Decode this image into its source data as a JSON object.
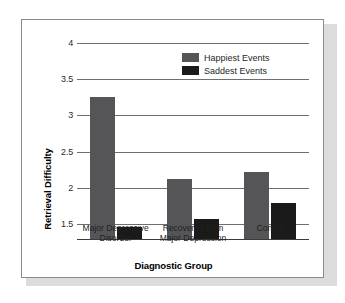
{
  "chart_data": {
    "type": "bar",
    "title": "",
    "xlabel": "Diagnostic Group",
    "ylabel": "Retrieval Difficulty",
    "categories": [
      "Major Depressive Disorder",
      "Recovered from Major Depression",
      "Control"
    ],
    "category_lines": [
      [
        "Major Depressive",
        "Disorder"
      ],
      [
        "Recovered from",
        "Major Depression"
      ],
      [
        "Control"
      ]
    ],
    "series": [
      {
        "name": "Happiest Events",
        "color": "#555558",
        "values": [
          3.25,
          2.12,
          2.22
        ]
      },
      {
        "name": "Saddest Events",
        "color": "#1a1a1a",
        "values": [
          1.47,
          1.58,
          1.79
        ]
      }
    ],
    "ylim": [
      1.3,
      4.05
    ],
    "yticks": [
      "4",
      "3.5",
      "3",
      "2.5",
      "2",
      "1.5"
    ],
    "ytick_values": [
      4,
      3.5,
      3,
      2.5,
      2,
      1.5
    ],
    "grid": true,
    "legend_position": "top-right"
  },
  "figure": {
    "border_color": "#8a8a8a",
    "background": "#ffffff"
  }
}
